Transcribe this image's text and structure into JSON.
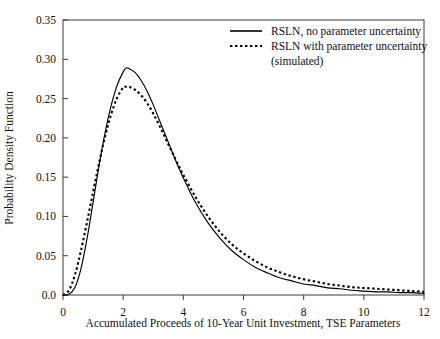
{
  "chart_data": {
    "type": "line",
    "title": "",
    "xlabel": "Accumulated Proceeds of 10-Year Unit Investment, TSE Parameters",
    "ylabel": "Probability Density Function",
    "xlim": [
      0,
      12
    ],
    "ylim": [
      0,
      0.35
    ],
    "grid": false,
    "legend_position": "top-right",
    "xticks": [
      0,
      2,
      4,
      6,
      8,
      10,
      12
    ],
    "xtick_labels": [
      "0",
      "2",
      "4",
      "6",
      "8",
      "10",
      "12"
    ],
    "yticks": [
      0.0,
      0.05,
      0.1,
      0.15,
      0.2,
      0.25,
      0.3,
      0.35
    ],
    "ytick_labels": [
      "0.0",
      "0.05",
      "0.10",
      "0.15",
      "0.20",
      "0.25",
      "0.30",
      "0.35"
    ],
    "x": [
      0.0,
      0.2,
      0.4,
      0.6,
      0.8,
      1.0,
      1.2,
      1.4,
      1.6,
      1.8,
      2.0,
      2.1,
      2.2,
      2.4,
      2.6,
      2.8,
      3.0,
      3.2,
      3.4,
      3.6,
      3.8,
      4.0,
      4.4,
      4.8,
      5.2,
      5.6,
      6.0,
      6.4,
      6.8,
      7.2,
      7.6,
      8.0,
      8.4,
      8.8,
      9.2,
      9.6,
      10.0,
      10.4,
      10.8,
      11.2,
      11.6,
      12.0
    ],
    "series": [
      {
        "name": "RSLN, no parameter uncertainty",
        "style": "solid",
        "color": "#000000",
        "peak_x": 2.1,
        "peak_y": 0.289,
        "values": [
          0.0,
          0.001,
          0.01,
          0.034,
          0.072,
          0.118,
          0.165,
          0.207,
          0.241,
          0.267,
          0.284,
          0.289,
          0.288,
          0.283,
          0.273,
          0.259,
          0.242,
          0.223,
          0.204,
          0.185,
          0.166,
          0.149,
          0.118,
          0.093,
          0.073,
          0.057,
          0.045,
          0.035,
          0.028,
          0.022,
          0.018,
          0.014,
          0.012,
          0.009,
          0.008,
          0.006,
          0.005,
          0.004,
          0.004,
          0.003,
          0.003,
          0.002
        ]
      },
      {
        "name": "RSLN with parameter uncertainty (simulated)",
        "style": "dotted",
        "color": "#000000",
        "peak_x": 2.0,
        "peak_y": 0.265,
        "values": [
          0.0,
          0.006,
          0.026,
          0.057,
          0.093,
          0.131,
          0.168,
          0.202,
          0.23,
          0.251,
          0.264,
          0.265,
          0.265,
          0.261,
          0.254,
          0.244,
          0.231,
          0.216,
          0.2,
          0.184,
          0.168,
          0.153,
          0.125,
          0.101,
          0.081,
          0.065,
          0.053,
          0.043,
          0.035,
          0.029,
          0.024,
          0.02,
          0.017,
          0.014,
          0.012,
          0.01,
          0.009,
          0.008,
          0.007,
          0.006,
          0.005,
          0.004
        ]
      }
    ]
  },
  "legend": {
    "entries": [
      {
        "label": "RSLN, no parameter uncertainty",
        "style": "solid"
      },
      {
        "label": "RSLN with parameter uncertainty",
        "style": "dotted"
      },
      {
        "label": "(simulated)",
        "style": "none"
      }
    ]
  }
}
